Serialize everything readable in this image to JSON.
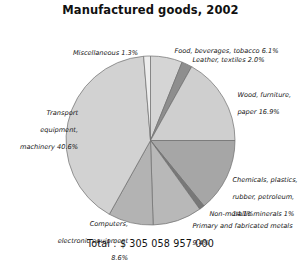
{
  "chart_data": {
    "type": "pie",
    "title": "Manufactured goods, 2002",
    "total_label": "Total : $ 305 058 957 000",
    "total_value": 305058957000,
    "currency": "$",
    "units": "percent of total",
    "legend": "none",
    "grid": false,
    "start_angle_deg": 0,
    "direction": "clockwise",
    "categories": [
      "Food, beverages, tobacco",
      "Leather, textiles",
      "Wood, furniture, paper",
      "Chemicals, plastics, rubber, petroleum",
      "Non-metallic minerals",
      "Primary and fabricated metals",
      "Computers, electronic equipment",
      "Transport equipment, machinery",
      "Miscellaneous"
    ],
    "values": [
      6.1,
      2.0,
      16.9,
      14.1,
      1.0,
      9.4,
      8.6,
      40.6,
      1.3
    ],
    "slices": [
      {
        "label": "Food, beverages, tobacco",
        "value": 6.1,
        "value_text": "6.1%",
        "color": "#d5d5d5"
      },
      {
        "label": "Leather, textiles",
        "value": 2.0,
        "value_text": "2.0%",
        "color": "#8e8e8e"
      },
      {
        "label": "Wood, furniture, paper",
        "value": 16.9,
        "value_text": "16.9%",
        "color": "#cfcfcf"
      },
      {
        "label": "Chemicals, plastics, rubber, petroleum",
        "value": 14.1,
        "value_text": "14.1%",
        "color": "#a6a6a6"
      },
      {
        "label": "Non-metallic minerals",
        "value": 1.0,
        "value_text": "1%",
        "color": "#787878"
      },
      {
        "label": "Primary and fabricated metals",
        "value": 9.4,
        "value_text": "9.4%",
        "color": "#b8b8b8"
      },
      {
        "label": "Computers, electronic equipment",
        "value": 8.6,
        "value_text": "8.6%",
        "color": "#b3b3b3"
      },
      {
        "label": "Transport equipment, machinery",
        "value": 40.6,
        "value_text": "40.6%",
        "color": "#d2d2d2"
      },
      {
        "label": "Miscellaneous",
        "value": 1.3,
        "value_text": "1.3%",
        "color": "#ededed"
      }
    ]
  },
  "annotations": {
    "miscellaneous": "Miscellaneous 1.3%",
    "food": "Food, beverages, tobacco 6.1%",
    "leather": "Leather, textiles 2.0%",
    "wood_line1": "Wood, furniture,",
    "wood_line2": "paper 16.9%",
    "chemicals_line1": "Chemicals, plastics,",
    "chemicals_line2": "rubber, petroleum,",
    "chemicals_line3": "14.1%",
    "nonmetallic": "Non-metallic minerals 1%",
    "primary_line1": "Primary and fabricated metals",
    "primary_line2": "9.4%",
    "computers_line1": "Computers,",
    "computers_line2": "electronic equipment",
    "computers_line3": "8.6%",
    "transport_line1": "Transport",
    "transport_line2": "equipment,",
    "transport_line3": "machinery 40.6%"
  },
  "colors": {
    "background": "#ffffff",
    "text": "#141414",
    "slice_outline": "#6f6f6f"
  }
}
